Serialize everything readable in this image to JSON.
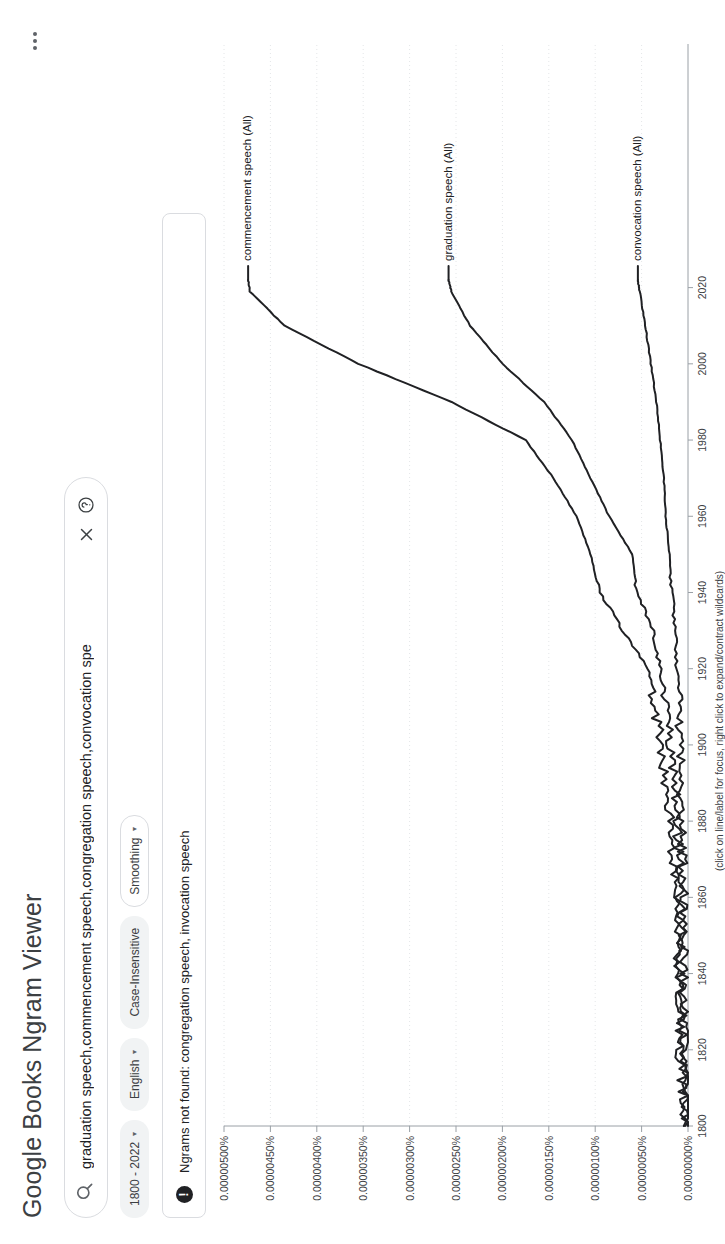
{
  "header": {
    "title": "Google Books Ngram Viewer",
    "overflow_icon": "kebab-menu-icon"
  },
  "search": {
    "icon": "search-icon",
    "value": "graduation speech,commencement speech,congregation speech,convocation spe",
    "clear_icon": "close-icon",
    "help_icon": "help-circle-icon"
  },
  "chips": [
    {
      "label": "1800 - 2022",
      "caret": "▾",
      "style": "filled"
    },
    {
      "label": "English",
      "caret": "▾",
      "style": "filled"
    },
    {
      "label": "Case-Insensitive",
      "caret": "",
      "style": "filled"
    },
    {
      "label": "Smoothing",
      "caret": "▾",
      "style": "outline"
    }
  ],
  "notice": {
    "icon": "warning-icon",
    "glyph": "!",
    "message": "Ngrams not found: congregation speech, invocation speech"
  },
  "footnote": "(click on line/label for focus, right click to expand/contract wildcards)",
  "chart_data": {
    "type": "line",
    "title": "",
    "xlabel": "",
    "ylabel": "",
    "xlim": [
      1800,
      2022
    ],
    "ylim": [
      0,
      5e-06
    ],
    "grid": true,
    "legend_position": "right-inline",
    "x_ticks": [
      1800,
      1820,
      1840,
      1860,
      1880,
      1900,
      1920,
      1940,
      1960,
      1980,
      2000,
      2020
    ],
    "y_ticks": [
      0,
      5e-07,
      1e-06,
      1.5e-06,
      2e-06,
      2.5e-06,
      3e-06,
      3.5e-06,
      4e-06,
      4.5e-06,
      5e-06
    ],
    "y_tick_labels": [
      "0.00000000%",
      "0.00000050%",
      "0.00000100%",
      "0.00000150%",
      "0.00000200%",
      "0.00000250%",
      "0.00000300%",
      "0.00000350%",
      "0.00000400%",
      "0.00000450%",
      "0.00000500%"
    ],
    "x_tick_labels": [
      "1800",
      "1820",
      "1840",
      "1860",
      "1880",
      "1900",
      "1920",
      "1940",
      "1960",
      "1980",
      "2000",
      "2020"
    ],
    "color": "#202124",
    "x": [
      1800,
      1810,
      1820,
      1830,
      1840,
      1850,
      1860,
      1870,
      1880,
      1890,
      1900,
      1910,
      1920,
      1930,
      1940,
      1950,
      1960,
      1970,
      1980,
      1990,
      2000,
      2010,
      2019,
      2022
    ],
    "series": [
      {
        "name": "commencement speech (All)",
        "label": "commencement speech (All)",
        "values": [
          2e-08,
          5e-08,
          1e-07,
          8e-08,
          1.2e-07,
          1e-07,
          1.4e-07,
          1.6e-07,
          2e-07,
          2.5e-07,
          3e-07,
          3.5e-07,
          4.2e-07,
          7e-07,
          9.5e-07,
          1.05e-06,
          1.2e-06,
          1.45e-06,
          1.75e-06,
          2.55e-06,
          3.55e-06,
          4.35e-06,
          4.72e-06,
          4.74e-06
        ]
      },
      {
        "name": "graduation speech (All)",
        "label": "graduation speech (All)",
        "values": [
          1e-08,
          3e-08,
          6e-08,
          5e-08,
          8e-08,
          7e-08,
          9e-08,
          1e-07,
          1.2e-07,
          1.4e-07,
          1.8e-07,
          2.2e-07,
          3e-07,
          3.8e-07,
          5.5e-07,
          6e-07,
          8.5e-07,
          1.05e-06,
          1.25e-06,
          1.55e-06,
          2e-06,
          2.35e-06,
          2.55e-06,
          2.58e-06
        ]
      },
      {
        "name": "convocation speech (All)",
        "label": "convocation speech (All)",
        "values": [
          1e-08,
          2e-08,
          4e-08,
          3e-08,
          5e-08,
          4e-08,
          5e-08,
          6e-08,
          7e-08,
          7e-08,
          9e-08,
          1e-07,
          1.2e-07,
          1.4e-07,
          1.7e-07,
          2e-07,
          2.4e-07,
          2.6e-07,
          3e-07,
          3.4e-07,
          4e-07,
          4.6e-07,
          5.2e-07,
          5.4e-07
        ]
      }
    ],
    "not_found": [
      "congregation speech",
      "invocation speech"
    ]
  }
}
